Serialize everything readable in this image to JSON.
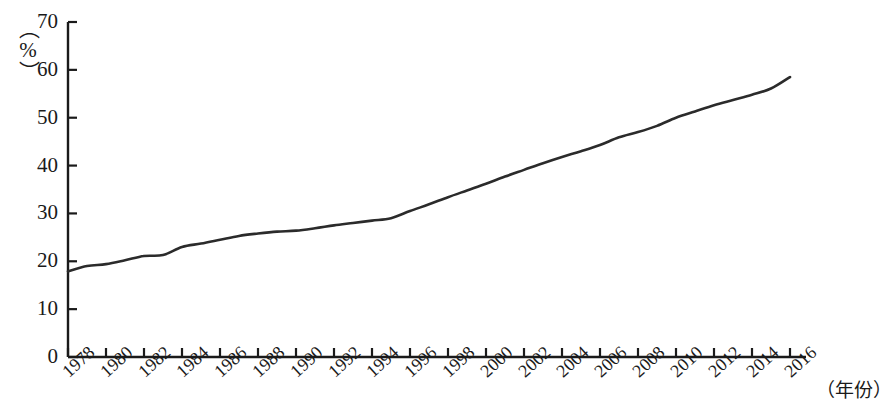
{
  "chart_data": {
    "type": "line",
    "title": "",
    "subtitle": "",
    "xlabel": "（年份）",
    "ylabel": "（%）",
    "ylabel_unit": "（%）",
    "xlim": [
      1978,
      2016
    ],
    "ylim": [
      0,
      70
    ],
    "ytick_step": 10,
    "xtick_step": 2,
    "grid": false,
    "legend": null,
    "legend_position": "none",
    "line_color": "#2b2b2b",
    "series_name": "城镇化率",
    "ytick_labels": [
      "70",
      "60",
      "50",
      "40",
      "30",
      "20",
      "10",
      "0"
    ],
    "ytick_values": [
      70,
      60,
      50,
      40,
      30,
      20,
      10,
      0
    ],
    "xtick_labels": [
      "1978",
      "1980",
      "1982",
      "1984",
      "1986",
      "1988",
      "1990",
      "1992",
      "1994",
      "1996",
      "1998",
      "2000",
      "2002",
      "2004",
      "2006",
      "2008",
      "2010",
      "2012",
      "2014",
      "2016"
    ],
    "xtick_values": [
      1978,
      1980,
      1982,
      1984,
      1986,
      1988,
      1990,
      1992,
      1994,
      1996,
      1998,
      2000,
      2002,
      2004,
      2006,
      2008,
      2010,
      2012,
      2014,
      2016
    ],
    "x": [
      1978,
      1979,
      1980,
      1981,
      1982,
      1983,
      1984,
      1985,
      1986,
      1987,
      1988,
      1989,
      1990,
      1991,
      1992,
      1993,
      1994,
      1995,
      1996,
      1997,
      1998,
      1999,
      2000,
      2001,
      2002,
      2003,
      2004,
      2005,
      2006,
      2007,
      2008,
      2009,
      2010,
      2011,
      2012,
      2013,
      2014,
      2015,
      2016
    ],
    "values": [
      17.9,
      19.0,
      19.4,
      20.2,
      21.1,
      21.3,
      23.0,
      23.7,
      24.5,
      25.3,
      25.8,
      26.2,
      26.4,
      26.9,
      27.5,
      28.0,
      28.5,
      29.0,
      30.5,
      31.9,
      33.4,
      34.8,
      36.2,
      37.7,
      39.1,
      40.5,
      41.8,
      43.0,
      44.3,
      45.9,
      47.0,
      48.3,
      50.0,
      51.3,
      52.6,
      53.7,
      54.8,
      56.1,
      58.5
    ],
    "first_point": {
      "year": 1978,
      "value": 17.9
    },
    "last_point": {
      "year": 2016,
      "value": 58.5
    }
  },
  "axes": {
    "y_axis_name": "y-axis",
    "x_axis_name": "x-axis"
  }
}
